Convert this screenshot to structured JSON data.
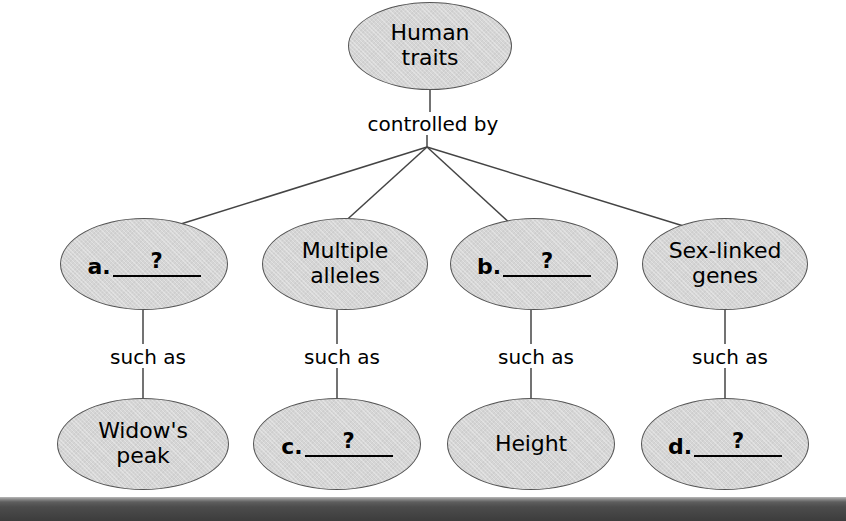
{
  "diagram": {
    "type": "concept-map",
    "background_color": "#ffffff",
    "node_fill_color": "#d5d5d5",
    "node_border_color": "#555555",
    "line_color": "#444444",
    "bottom_bar_color": "#3c3c3c",
    "nodes": {
      "root": {
        "label": "Human\ntraits"
      },
      "level2": [
        {
          "letter": "a.",
          "placeholder": "?"
        },
        {
          "label": "Multiple\nalleles"
        },
        {
          "letter": "b.",
          "placeholder": "?"
        },
        {
          "label": "Sex-linked\ngenes"
        }
      ],
      "level3": [
        {
          "label": "Widow's\npeak"
        },
        {
          "letter": "c.",
          "placeholder": "?"
        },
        {
          "label": "Height"
        },
        {
          "letter": "d.",
          "placeholder": "?"
        }
      ]
    },
    "edge_labels": {
      "root_link": "controlled by",
      "such_as": [
        "such as",
        "such as",
        "such as",
        "such as"
      ]
    }
  }
}
